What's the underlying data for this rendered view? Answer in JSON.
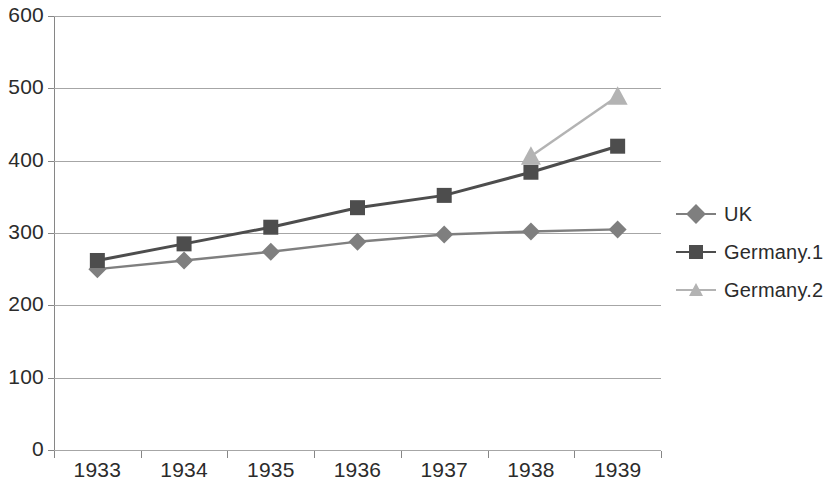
{
  "chart_data": {
    "type": "line",
    "title": "",
    "xlabel": "",
    "ylabel": "",
    "categories": [
      "1933",
      "1934",
      "1935",
      "1936",
      "1937",
      "1938",
      "1939"
    ],
    "ylim": [
      0,
      600
    ],
    "yticks": [
      0,
      100,
      200,
      300,
      400,
      500,
      600
    ],
    "ytick_labels": [
      "0",
      "100",
      "200",
      "300",
      "400",
      "500",
      "600"
    ],
    "grid": "horizontal",
    "legend_position": "right",
    "series": [
      {
        "name": "UK",
        "marker": "diamond",
        "color": "#7f7f7f",
        "values": [
          250,
          262,
          274,
          288,
          298,
          302,
          305
        ]
      },
      {
        "name": "Germany.1",
        "marker": "square",
        "color": "#4d4d4d",
        "values": [
          262,
          285,
          308,
          335,
          352,
          384,
          420
        ]
      },
      {
        "name": "Germany.2",
        "marker": "triangle",
        "color": "#b3b3b3",
        "values": [
          null,
          null,
          null,
          null,
          null,
          406,
          489
        ]
      }
    ]
  },
  "axes": {
    "y_tick_labels": [
      "600",
      "500",
      "400",
      "300",
      "200",
      "100",
      "0"
    ],
    "x_tick_labels": [
      "1933",
      "1934",
      "1935",
      "1936",
      "1937",
      "1938",
      "1939"
    ]
  },
  "legend": {
    "items": [
      {
        "label": "UK",
        "marker": "diamond-marker-icon",
        "color": "#7f7f7f"
      },
      {
        "label": "Germany.1",
        "marker": "square-marker-icon",
        "color": "#4d4d4d"
      },
      {
        "label": "Germany.2",
        "marker": "triangle-marker-icon",
        "color": "#b3b3b3"
      }
    ]
  },
  "colors": {
    "gridline": "#a6a6a6",
    "axis": "#868686",
    "text": "#2b2b2b",
    "background": "#ffffff"
  }
}
